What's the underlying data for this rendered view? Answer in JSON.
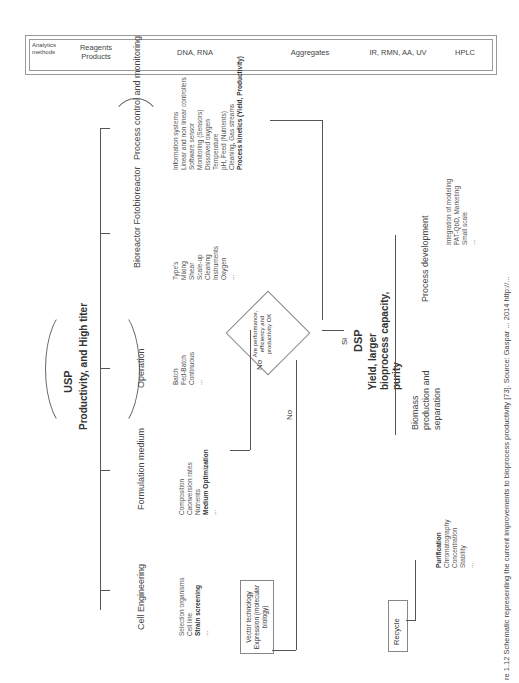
{
  "header": {
    "cells": [
      {
        "label": "Analytics methods"
      },
      {
        "label": "Reagents Products"
      },
      {
        "label": "DNA, RNA"
      },
      {
        "label": "Aggregates"
      },
      {
        "label": "IR, RMN, AA, UV"
      },
      {
        "label": "HPLC"
      }
    ]
  },
  "usp": {
    "title": "USP",
    "subtitle": "Productivity, and High titer",
    "stages": [
      {
        "label": "Cell Engineering",
        "items": [
          "Selection organisms",
          "Cell line",
          "Strain screening",
          "..."
        ],
        "bold_index": 2
      },
      {
        "label": "Formulation medium",
        "items": [
          "Composition",
          "Caonversion rates",
          "Nutrients",
          "Medium Optimization",
          "..."
        ],
        "bold_index": 3
      },
      {
        "label": "Operation",
        "items": [
          "Batch",
          "Fed-Batch",
          "Continuous",
          "..."
        ]
      },
      {
        "label": "Bioreactor Fotobioreactor",
        "items": [
          "Type's",
          "Mixing",
          "Shear",
          "Scale-up",
          "Cleaning",
          "Instruments",
          "Oxygen",
          "..."
        ]
      },
      {
        "label": "Process control and monitoring",
        "items": [
          "Information systems",
          "Linear and non linear controllers",
          "Software sensor",
          "Monitoring (Sensors)",
          "Dissolved oxygen",
          "Temperature",
          "pH, Feed (Nutrients)",
          "Cleaning, Gas streams",
          "Process kinetics (Yield, Productivity)"
        ],
        "bold_index": 8
      }
    ]
  },
  "decision": {
    "question": "Are performance, efficiency and productivity OK",
    "no_left": "No",
    "no_bottom": "No",
    "yes": "Si"
  },
  "vector_box": "Vector technology Expression (molecular biology)",
  "dsp": {
    "title": "DSP",
    "subtitle": "Yield, larger bioprocess capacity, purity",
    "stages": [
      {
        "label": "Biomass production and separation",
        "items": [
          "Purification",
          "Chromatography",
          "Concentration",
          "Stability",
          "..."
        ],
        "bold_index": 0
      },
      {
        "label": "Process development",
        "items": [
          "Integration of modeling",
          "PAT-QbD, Marketing",
          "Small scale",
          "..."
        ]
      }
    ]
  },
  "recycle_box": "Recycle",
  "caption": "re 1.12  Schematic representing the current improvements to bioprocess productivity [73]. Source: Gaspar ... 2014 http://..."
}
